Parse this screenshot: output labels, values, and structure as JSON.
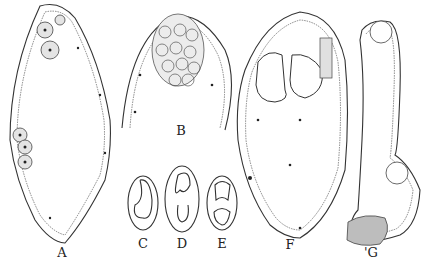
{
  "figure": {
    "type": "scientific-illustration",
    "panels": [
      {
        "id": "A",
        "label": "A",
        "x": 62,
        "y": 245
      },
      {
        "id": "B",
        "label": "B",
        "x": 181,
        "y": 123
      },
      {
        "id": "C",
        "label": "C",
        "x": 143,
        "y": 236
      },
      {
        "id": "D",
        "label": "D",
        "x": 182,
        "y": 236
      },
      {
        "id": "E",
        "label": "E",
        "x": 222,
        "y": 236
      },
      {
        "id": "F",
        "label": "F",
        "x": 290,
        "y": 237
      },
      {
        "id": "G",
        "label": "'G",
        "x": 371,
        "y": 245
      }
    ]
  }
}
